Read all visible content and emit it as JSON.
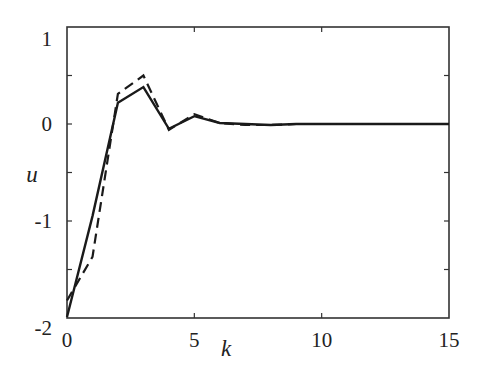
{
  "chart_data": {
    "type": "line",
    "title": "",
    "xlabel": "k",
    "ylabel": "u",
    "xlim": [
      0,
      15
    ],
    "ylim": [
      -2,
      1
    ],
    "grid": false,
    "legend": null,
    "x_ticks": [
      0,
      5,
      10,
      15
    ],
    "x_tick_labels": [
      "0",
      "5",
      "10",
      "15"
    ],
    "y_ticks": [
      -2,
      -1,
      0,
      1
    ],
    "y_tick_labels": [
      "-2",
      "-1",
      "0",
      "1"
    ],
    "y_minor_ticks": [
      -1.5,
      -0.5,
      0.5
    ],
    "series": [
      {
        "name": "solid",
        "style": "solid",
        "x": [
          0,
          1,
          2,
          3,
          4,
          5,
          6,
          7,
          8,
          9,
          10,
          11,
          12,
          13,
          14,
          15
        ],
        "values": [
          -1.99,
          -0.95,
          0.22,
          0.38,
          -0.05,
          0.08,
          0.01,
          0.0,
          -0.01,
          0.0,
          0.0,
          0.0,
          0.0,
          0.0,
          0.0,
          0.0
        ]
      },
      {
        "name": "dashed",
        "style": "dashed",
        "x": [
          0,
          1,
          2,
          3,
          4,
          5,
          6,
          7,
          8,
          9,
          10,
          11,
          12,
          13,
          14,
          15
        ],
        "values": [
          -1.82,
          -1.37,
          0.31,
          0.5,
          -0.06,
          0.1,
          0.01,
          -0.01,
          -0.01,
          0.0,
          0.0,
          0.0,
          0.0,
          0.0,
          0.0,
          0.0
        ]
      }
    ]
  }
}
